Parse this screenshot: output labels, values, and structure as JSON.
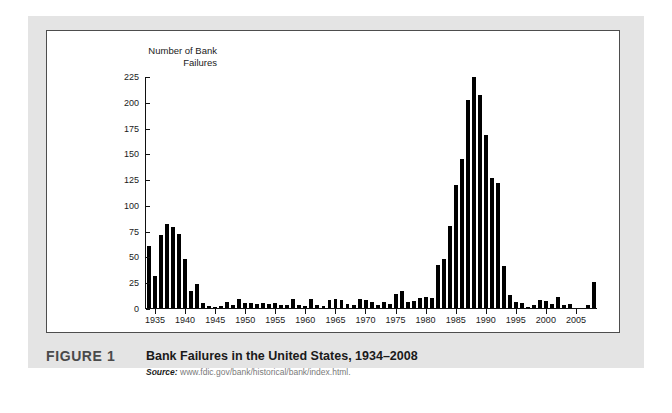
{
  "figure": {
    "label": "FIGURE 1",
    "title": "Bank Failures in the United States, 1934–2008",
    "source_prefix": "Source:",
    "source_url": "www.fdic.gov/bank/historical/bank/index.html."
  },
  "colors": {
    "page_background": "#e4e4e4",
    "panel_background": "#ffffff",
    "panel_border": "#4d4d4d",
    "bar": "#000000",
    "axis": "#111111",
    "caption_label": "#4a4a4a",
    "source_text": "#7a7a7a"
  },
  "chart_data": {
    "type": "bar",
    "title": "Bank Failures in the United States, 1934–2008",
    "xlabel": "",
    "ylabel": "Number of Bank Failures",
    "ylim": [
      0,
      225
    ],
    "yticks": [
      0,
      25,
      50,
      75,
      100,
      125,
      150,
      175,
      200,
      225
    ],
    "xticks": [
      1935,
      1940,
      1945,
      1950,
      1955,
      1960,
      1965,
      1970,
      1975,
      1980,
      1985,
      1990,
      1995,
      2000,
      2005
    ],
    "grid": false,
    "legend": null,
    "categories": [
      1934,
      1935,
      1936,
      1937,
      1938,
      1939,
      1940,
      1941,
      1942,
      1943,
      1944,
      1945,
      1946,
      1947,
      1948,
      1949,
      1950,
      1951,
      1952,
      1953,
      1954,
      1955,
      1956,
      1957,
      1958,
      1959,
      1960,
      1961,
      1962,
      1963,
      1964,
      1965,
      1966,
      1967,
      1968,
      1969,
      1970,
      1971,
      1972,
      1973,
      1974,
      1975,
      1976,
      1977,
      1978,
      1979,
      1980,
      1981,
      1982,
      1983,
      1984,
      1985,
      1986,
      1987,
      1988,
      1989,
      1990,
      1991,
      1992,
      1993,
      1994,
      1995,
      1996,
      1997,
      1998,
      1999,
      2000,
      2001,
      2002,
      2003,
      2004,
      2005,
      2006,
      2007,
      2008
    ],
    "values": [
      60,
      31,
      71,
      82,
      79,
      72,
      48,
      17,
      23,
      5,
      2,
      1,
      2,
      6,
      3,
      9,
      5,
      5,
      4,
      5,
      4,
      5,
      3,
      3,
      9,
      3,
      2,
      9,
      3,
      2,
      8,
      9,
      8,
      4,
      3,
      9,
      8,
      6,
      3,
      6,
      4,
      14,
      17,
      6,
      7,
      10,
      11,
      10,
      42,
      48,
      80,
      120,
      145,
      203,
      279,
      207,
      169,
      127,
      122,
      41,
      13,
      6,
      5,
      1,
      3,
      8,
      7,
      4,
      11,
      3,
      4,
      0,
      0,
      3,
      25
    ],
    "note": "Bar heights read against a 0–225 axis; values above 225 are drawn clipped at the top of the plot area."
  }
}
